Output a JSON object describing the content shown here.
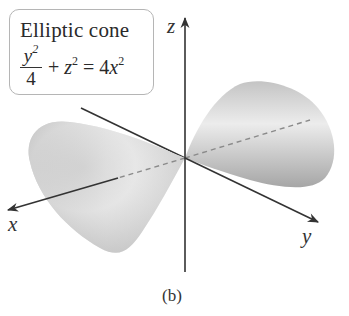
{
  "figure": {
    "label_box": {
      "title": "Elliptic cone",
      "equation": {
        "fraction_numerator": "y",
        "fraction_numerator_exp": "2",
        "fraction_denominator": "4",
        "plus": "+",
        "term2_var": "z",
        "term2_exp": "2",
        "equals": "=",
        "rhs_coef": "4",
        "rhs_var": "x",
        "rhs_exp": "2"
      },
      "plain_text": "y^2/4 + z^2 = 4x^2"
    },
    "axes": {
      "x_label": "x",
      "y_label": "y",
      "z_label": "z"
    },
    "caption": "(b)",
    "colors": {
      "axis": "#333333",
      "surface_light": "#ececec",
      "surface_dark": "#a8a8a8",
      "box_border": "#b5b5b5"
    }
  }
}
